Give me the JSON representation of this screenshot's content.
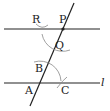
{
  "diagram": {
    "type": "geometric-construction",
    "labels": {
      "R": "R",
      "P": "P",
      "Q": "Q",
      "B": "B",
      "A": "A",
      "C": "C",
      "l": "l"
    },
    "colors": {
      "line": "#222222",
      "arc": "#888888",
      "background": "#ffffff"
    }
  }
}
